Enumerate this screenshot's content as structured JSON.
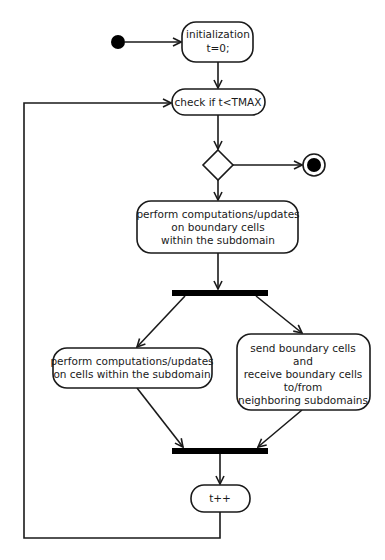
{
  "diagram": {
    "type": "UML activity diagram",
    "colors": {
      "stroke": "#1a1a1a",
      "fill": "#ffffff",
      "bar": "#000000",
      "background": "#ffffff"
    },
    "nodes": {
      "start": {
        "kind": "initial-node"
      },
      "init": {
        "kind": "action",
        "lines": [
          "initialization",
          "t=0;"
        ]
      },
      "check": {
        "kind": "action",
        "lines": [
          "check if t<TMAX"
        ]
      },
      "decision": {
        "kind": "decision"
      },
      "end": {
        "kind": "final-node"
      },
      "boundary": {
        "kind": "action",
        "lines": [
          "perform computations/updates",
          "on boundary cells",
          "within the subdomain"
        ]
      },
      "fork": {
        "kind": "fork-bar"
      },
      "inner": {
        "kind": "action",
        "lines": [
          "perform computations/updates",
          "on cells within the subdomain"
        ]
      },
      "exchange": {
        "kind": "action",
        "lines": [
          "send boundary cells",
          "and",
          "receive boundary cells",
          "to/from",
          "neighboring subdomains"
        ]
      },
      "join": {
        "kind": "join-bar"
      },
      "increment": {
        "kind": "action",
        "lines": [
          "t++"
        ]
      }
    },
    "edges": [
      {
        "from": "start",
        "to": "init"
      },
      {
        "from": "init",
        "to": "check"
      },
      {
        "from": "check",
        "to": "decision"
      },
      {
        "from": "decision",
        "to": "end"
      },
      {
        "from": "decision",
        "to": "boundary"
      },
      {
        "from": "boundary",
        "to": "fork"
      },
      {
        "from": "fork",
        "to": "inner"
      },
      {
        "from": "fork",
        "to": "exchange"
      },
      {
        "from": "inner",
        "to": "join"
      },
      {
        "from": "exchange",
        "to": "join"
      },
      {
        "from": "join",
        "to": "increment"
      },
      {
        "from": "increment",
        "to": "check",
        "label": "loop back"
      }
    ]
  }
}
